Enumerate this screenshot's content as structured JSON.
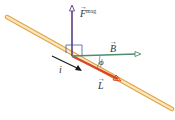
{
  "diagram": {
    "labels": {
      "force": "F",
      "force_superscript": "mag",
      "field": "B",
      "length": "L",
      "current": "i",
      "angle": "ϕ"
    },
    "colors": {
      "wire": "#f3cf8a",
      "wire_edge": "#e0a64a",
      "force_vector": "#5b3f86",
      "field_vector": "#4f8c6e",
      "length_vector": "#d8452c",
      "current_arrow": "#1a1a1a",
      "right_angle": "#3a5fa8"
    }
  }
}
